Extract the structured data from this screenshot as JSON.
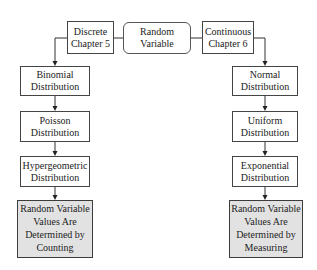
{
  "diagram": {
    "root": {
      "lines": [
        "Random",
        "Variable"
      ]
    },
    "discrete": {
      "lines": [
        "Discrete",
        "Chapter 5"
      ]
    },
    "continuous": {
      "lines": [
        "Continuous",
        "Chapter 6"
      ]
    },
    "left_column": [
      {
        "lines": [
          "Binomial",
          "Distribution"
        ]
      },
      {
        "lines": [
          "Poisson",
          "Distribution"
        ]
      },
      {
        "lines": [
          "Hypergeometric",
          "Distribution"
        ]
      },
      {
        "lines": [
          "Random Variable",
          "Values Are",
          "Determined by",
          "Counting"
        ],
        "shaded": true
      }
    ],
    "right_column": [
      {
        "lines": [
          "Normal",
          "Distribution"
        ]
      },
      {
        "lines": [
          "Uniform",
          "Distribution"
        ]
      },
      {
        "lines": [
          "Exponential",
          "Distribution"
        ]
      },
      {
        "lines": [
          "Random Variable",
          "Values Are",
          "Determined by",
          "Measuring"
        ],
        "shaded": true
      }
    ],
    "colors": {
      "border": "#444444",
      "shaded_fill": "#e2e2e2",
      "text": "#222222",
      "background": "#ffffff"
    }
  }
}
